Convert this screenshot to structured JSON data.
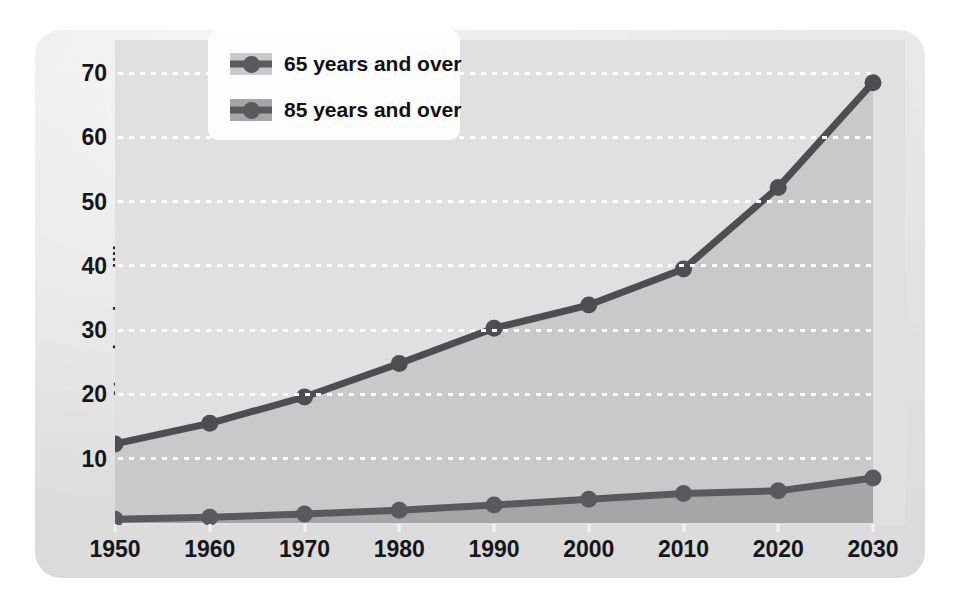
{
  "chart_data": {
    "type": "area",
    "title": "",
    "xlabel": "",
    "ylabel": "Number in millions",
    "categories": [
      "1950",
      "1960",
      "1970",
      "1980",
      "1990",
      "2000",
      "2010",
      "2020",
      "2030"
    ],
    "x": [
      1950,
      1960,
      1970,
      1980,
      1990,
      2000,
      2010,
      2020,
      2030
    ],
    "xlim": [
      1950,
      2030
    ],
    "ylim": [
      0,
      73
    ],
    "yticks": [
      10,
      20,
      30,
      40,
      50,
      60,
      70
    ],
    "ytick_labels": [
      "10",
      "20",
      "30",
      "40",
      "50",
      "60",
      "70"
    ],
    "grid": "horizontal-dotted-white",
    "legend_position": "top-center-left",
    "series": [
      {
        "name": "65 years and over",
        "values": [
          12.3,
          15.5,
          19.6,
          24.8,
          30.3,
          33.9,
          39.5,
          52.2,
          68.5
        ],
        "line_color": "#4e4e52",
        "fill_color": "#c9c9c9"
      },
      {
        "name": "85 years and over",
        "values": [
          0.6,
          0.9,
          1.4,
          2.0,
          2.8,
          3.7,
          4.6,
          5.0,
          7.0
        ],
        "line_color": "#5a5a5e",
        "fill_color": "#a6a6a6"
      }
    ]
  },
  "legend": {
    "items": [
      {
        "label": "65 years and over",
        "swatch_color": "#c9c9c9",
        "marker_color": "#5a5a5e"
      },
      {
        "label": "85 years and over",
        "swatch_color": "#a6a6a6",
        "marker_color": "#5a5a5e"
      }
    ]
  },
  "axes": {
    "y_title": "Number in millions",
    "y_ticks": [
      "70",
      "60",
      "50",
      "40",
      "30",
      "20",
      "10"
    ],
    "x_ticks": [
      "1950",
      "1960",
      "1970",
      "1980",
      "1990",
      "2000",
      "2010",
      "2020",
      "2030"
    ]
  },
  "colors": {
    "card_background": "#e2e2e2",
    "plot_background": "#e0e0e0",
    "grid": "#ffffff",
    "text": "#15151a",
    "series_65_fill": "#c9c9c9",
    "series_85_fill": "#a6a6a6",
    "line": "#4e4e52"
  }
}
